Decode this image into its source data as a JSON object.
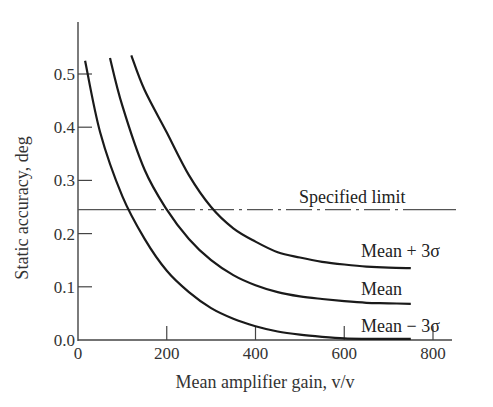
{
  "chart_data": {
    "type": "line",
    "title": "",
    "xlabel": "Mean amplifier gain, v/v",
    "ylabel": "Static accuracy, deg",
    "xlim": [
      0,
      840
    ],
    "ylim": [
      0,
      0.58
    ],
    "x_ticks": [
      0,
      200,
      400,
      600,
      800
    ],
    "x_tick_labels": [
      "0",
      "200",
      "400",
      "600",
      "800"
    ],
    "y_ticks": [
      0.0,
      0.1,
      0.2,
      0.3,
      0.4,
      0.5
    ],
    "y_tick_labels": [
      "0.0",
      "0.1",
      "0.2",
      "0.3",
      "0.4",
      "0.5"
    ],
    "grid": false,
    "legend": "inline labels at right end of curves",
    "series": [
      {
        "name": "Mean + 3σ",
        "label": "Mean + 3σ",
        "x": [
          120,
          150,
          200,
          250,
          300,
          350,
          400,
          450,
          500,
          550,
          600,
          650,
          700,
          750
        ],
        "values": [
          0.535,
          0.47,
          0.39,
          0.31,
          0.25,
          0.21,
          0.185,
          0.165,
          0.155,
          0.147,
          0.142,
          0.138,
          0.136,
          0.135
        ]
      },
      {
        "name": "Mean",
        "label": "Mean",
        "x": [
          72,
          100,
          150,
          200,
          250,
          300,
          350,
          400,
          450,
          500,
          550,
          600,
          650,
          700,
          750
        ],
        "values": [
          0.53,
          0.44,
          0.32,
          0.245,
          0.19,
          0.15,
          0.122,
          0.103,
          0.09,
          0.082,
          0.077,
          0.073,
          0.07,
          0.069,
          0.068
        ]
      },
      {
        "name": "Mean − 3σ",
        "label": "Mean − 3σ",
        "x": [
          16,
          50,
          100,
          150,
          200,
          250,
          300,
          350,
          400,
          450,
          500,
          550,
          600,
          650,
          700,
          750
        ],
        "values": [
          0.525,
          0.39,
          0.27,
          0.19,
          0.13,
          0.09,
          0.06,
          0.04,
          0.026,
          0.016,
          0.01,
          0.006,
          0.003,
          0.002,
          0.002,
          0.002
        ]
      }
    ],
    "reference_lines": [
      {
        "label": "Specified limit",
        "y": 0.245,
        "style": "dash-dot then solid"
      }
    ],
    "colors": {
      "curve": "#1a1a1a",
      "axis": "#444444",
      "limit": "#555555"
    }
  }
}
